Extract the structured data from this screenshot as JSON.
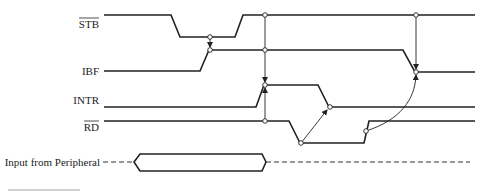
{
  "diagram": {
    "type": "timing-diagram",
    "signals": [
      {
        "id": "stb",
        "label": "STB",
        "overbar": true,
        "initial": "high"
      },
      {
        "id": "ibf",
        "label": "IBF",
        "overbar": false,
        "initial": "low"
      },
      {
        "id": "intr",
        "label": "INTR",
        "overbar": false,
        "initial": "low"
      },
      {
        "id": "rd",
        "label": "RD",
        "overbar": true,
        "initial": "high"
      },
      {
        "id": "input",
        "label": "Input from Peripheral",
        "overbar": false,
        "initial": "data-valid-window"
      }
    ],
    "causal_arrows": [
      {
        "from": "STB falling edge",
        "to": "IBF rising edge"
      },
      {
        "from": "STB rising edge",
        "to": "INTR rising edge"
      },
      {
        "from": "RD falling edge",
        "to": "INTR falling edge"
      },
      {
        "from": "RD rising edge",
        "to": "IBF falling edge"
      },
      {
        "from": "STB high reference",
        "to": "IBF falling edge"
      }
    ],
    "caption_fragment": ""
  }
}
